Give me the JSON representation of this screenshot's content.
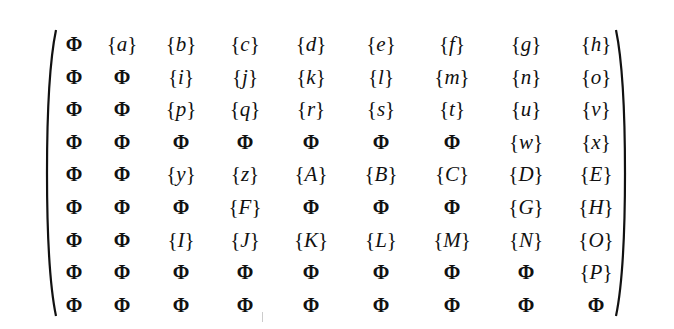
{
  "matrix": {
    "empty_symbol": "Φ",
    "rows": [
      [
        "Φ",
        "{a}",
        "{b}",
        "{c}",
        "{d}",
        "{e}",
        "{f}",
        "{g}",
        "{h}"
      ],
      [
        "Φ",
        "Φ",
        "{i}",
        "{j}",
        "{k}",
        "{l}",
        "{m}",
        "{n}",
        "{o}"
      ],
      [
        "Φ",
        "Φ",
        "{p}",
        "{q}",
        "{r}",
        "{s}",
        "{t}",
        "{u}",
        "{v}"
      ],
      [
        "Φ",
        "Φ",
        "Φ",
        "Φ",
        "Φ",
        "Φ",
        "Φ",
        "{w}",
        "{x}"
      ],
      [
        "Φ",
        "Φ",
        "{y}",
        "{z}",
        "{A}",
        "{B}",
        "{C}",
        "{D}",
        "{E}"
      ],
      [
        "Φ",
        "Φ",
        "Φ",
        "{F}",
        "Φ",
        "Φ",
        "Φ",
        "{G}",
        "{H}"
      ],
      [
        "Φ",
        "Φ",
        "{I}",
        "{J}",
        "{K}",
        "{L}",
        "{M}",
        "{N}",
        "{O}"
      ],
      [
        "Φ",
        "Φ",
        "Φ",
        "Φ",
        "Φ",
        "Φ",
        "Φ",
        "Φ",
        "{P}"
      ],
      [
        "Φ",
        "Φ",
        "Φ",
        "Φ",
        "Φ",
        "Φ",
        "Φ",
        "Φ",
        "Φ"
      ]
    ]
  }
}
